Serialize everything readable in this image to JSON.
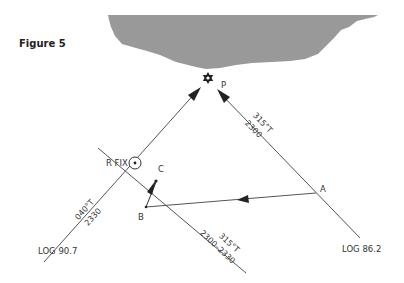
{
  "figure": {
    "title": "Figure 5"
  },
  "landmass": {
    "color": "#999999"
  },
  "points": {
    "p": {
      "label": "P",
      "icon": "lighthouse-star-icon"
    },
    "r_fix": {
      "label": "R FIX",
      "icon": "fix-circle-icon"
    },
    "a": {
      "label": "A"
    },
    "b": {
      "label": "B"
    },
    "c": {
      "label": "C"
    }
  },
  "lines": {
    "left_bearing": {
      "bearing": "040°T",
      "time": "2330",
      "log": "LOG 90.7"
    },
    "right_bearing": {
      "bearing": "315°T",
      "time": "2300",
      "log": "LOG 86.2"
    },
    "transferred_bearing": {
      "bearing": "315°T",
      "time": "2300–2330"
    }
  },
  "colors": {
    "line": "#555555",
    "text": "#333333",
    "land": "#999999"
  }
}
